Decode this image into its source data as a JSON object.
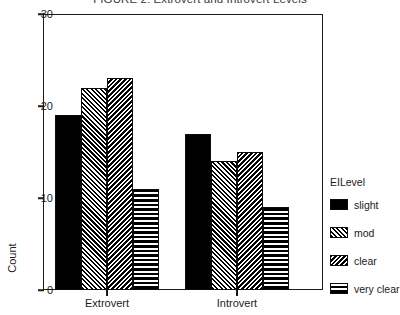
{
  "chart_data": {
    "type": "bar",
    "title": "FIGURE 2: Extrovert and Introvert Levels",
    "xlabel": "",
    "ylabel": "Count",
    "categories": [
      "Extrovert",
      "Introvert"
    ],
    "series": [
      {
        "name": "slight",
        "pattern": "solid",
        "values": [
          19,
          17
        ]
      },
      {
        "name": "mod",
        "pattern": "diagonal",
        "values": [
          22,
          14
        ]
      },
      {
        "name": "clear",
        "pattern": "diagonal-dense",
        "values": [
          23,
          15
        ]
      },
      {
        "name": "very clear",
        "pattern": "horizontal-lines",
        "values": [
          11,
          9
        ]
      }
    ],
    "ylim": [
      0,
      30
    ],
    "yticks": [
      0,
      10,
      20,
      30
    ],
    "ytick_labels": [
      "0",
      "10",
      "20",
      "30"
    ],
    "grid": false,
    "legend": {
      "title": "EILevel",
      "position": "right",
      "entries": [
        "slight",
        "mod",
        "clear",
        "very clear"
      ]
    },
    "colors": {
      "bar": "#000000",
      "axis": "#1a1a1a",
      "background": "#ffffff",
      "text": "#1b1b1b"
    }
  }
}
